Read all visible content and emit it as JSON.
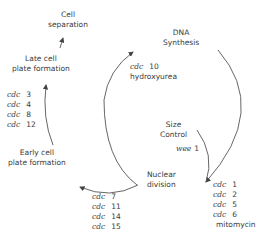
{
  "diagram": {
    "stages": {
      "cell_separation": [
        "Cell",
        "separation"
      ],
      "late_plate": [
        "Late cell",
        "plate formation"
      ],
      "early_plate": [
        "Early cell",
        "plate formation"
      ],
      "dna_synthesis": [
        "DNA",
        "Synthesis"
      ],
      "size_control": [
        "Size",
        "Control"
      ],
      "nuclear_division": [
        "Nuclear",
        "division"
      ]
    },
    "blocks": {
      "late_plate_genes": [
        {
          "prefix": "cdc",
          "num": "3"
        },
        {
          "prefix": "cdc",
          "num": "4"
        },
        {
          "prefix": "cdc",
          "num": "8"
        },
        {
          "prefix": "cdc",
          "num": "12"
        }
      ],
      "dna_genes": [
        {
          "prefix": "cdc",
          "num": "10"
        }
      ],
      "dna_inhibitor": "hydroxyurea",
      "size_gene": {
        "prefix": "wee",
        "num": "1"
      },
      "early_plate_genes": [
        {
          "prefix": "cdc",
          "num": "7"
        },
        {
          "prefix": "cdc",
          "num": "11"
        },
        {
          "prefix": "cdc",
          "num": "14"
        },
        {
          "prefix": "cdc",
          "num": "15"
        }
      ],
      "nuclear_genes": [
        {
          "prefix": "cdc",
          "num": "1"
        },
        {
          "prefix": "cdc",
          "num": "2"
        },
        {
          "prefix": "cdc",
          "num": "5"
        },
        {
          "prefix": "cdc",
          "num": "6"
        }
      ],
      "nuclear_inhibitor": "mitomycin"
    },
    "line_color": "#555555"
  }
}
